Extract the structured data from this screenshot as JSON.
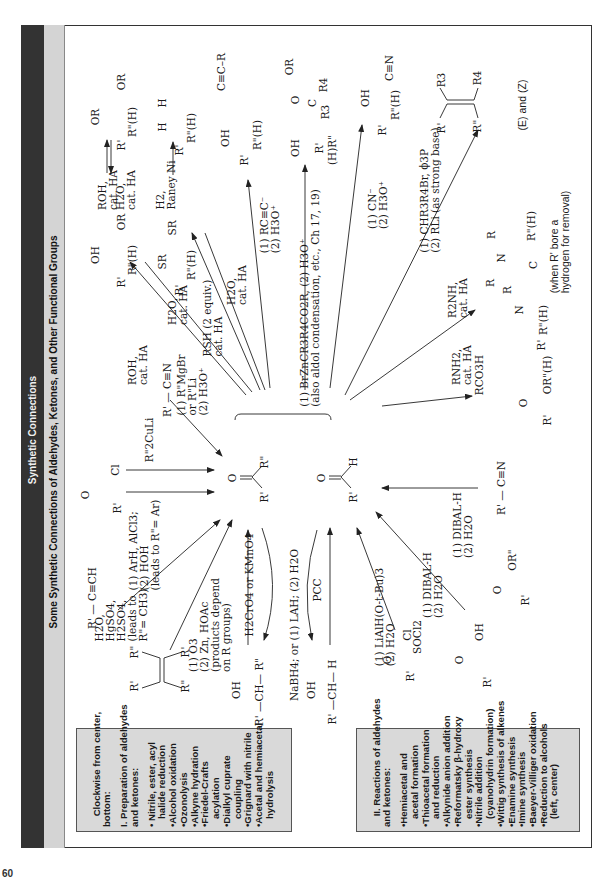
{
  "header": {
    "title": "Synthetic Connections",
    "subtitle": "Some Synthetic Connections of Aldehydes, Ketones, and Other Functional Groups"
  },
  "center": {
    "ketone": {
      "o": "O",
      "left": "R'",
      "right": "R\""
    },
    "aldehyde": {
      "o": "O",
      "left": "R'",
      "right": "H"
    }
  },
  "products": {
    "hemiacetal": {
      "oh": "OH",
      "or": "OR",
      "r1": "R'",
      "r2": "R\"(H)"
    },
    "acetal": {
      "or1": "OR",
      "or2": "OR",
      "r1": "R'",
      "r2": "R\"(H)"
    },
    "acetal_reagents": {
      "forward": "ROH,\ncat. HA",
      "reverse": "H2O,\ncat. HA"
    },
    "thioacetal": {
      "sr1": "SR",
      "sr2": "SR",
      "r1": "R'",
      "r2": "R\"(H)"
    },
    "thio_reduction_reagents": "H2,\nRaney Ni",
    "alkane": {
      "h1": "H",
      "h2": "H",
      "r1": "R'",
      "r2": "R\"(H)"
    },
    "propargyl_alcohol": {
      "oh": "OH",
      "chain": "C≡C–R",
      "r1": "R'",
      "r2": "R\"(H)"
    },
    "beta_hydroxy_ester": {
      "oh": "OH",
      "o": "O",
      "or": "OR",
      "c": "C",
      "r3": "R3",
      "r4": "R4",
      "r1": "R'",
      "r2": "(H)R\""
    },
    "cyanohydrin": {
      "oh": "OH",
      "cn": "C≡N",
      "r1": "R'",
      "r2": "R\"(H)"
    },
    "alkene": {
      "r3": "R3",
      "r4": "R4",
      "r1": "R'",
      "r2": "R\"",
      "note": "(E) and (Z)"
    },
    "enamine": {
      "r_a": "R",
      "r_b": "R",
      "n": "N",
      "c": "C",
      "r2": "R\"(H)",
      "note": "(when R' bore a\nhydrogen for removal)"
    },
    "imine": {
      "r": "R",
      "n": "N",
      "r1": "R'",
      "r2": "R\"(H)"
    },
    "ester": {
      "o": "O",
      "r1": "R'",
      "or": "OR\"(H)"
    }
  },
  "reagents": {
    "hemiacetal_form": "ROH,\ncat. HA",
    "hemiacetal_hydrolysis": "H2O,\ncat. HA",
    "thioacetal_form": "RSH (2 equiv.)\ncat. HA",
    "thioacetal_hydrolysis": "H2O,\ncat. HA",
    "alkynide": "(1) RC≡C⁻\n(2) H3O⁺",
    "reformatsky": "(1) BrZnCR3R4CO2R, (2) H3O⁺\n(also aldol condensation, etc., Ch 17, 19)",
    "cyanide": "(1) CN⁻\n(2) H3O⁺",
    "wittig": "(1) CHR3R4Br, ϕ3P\n(2) RLi (as strong base)",
    "enamine": "R2NH,\ncat. HA",
    "imine": "RNH2,\ncat. HA",
    "baeyer_villiger": "RCO3H",
    "nitrile_dibal": "(1) DIBAL-H\n(2) H2O",
    "ester_dibal": "(1) DIBAL-H\n(2) H2O",
    "acid_chloride_lialh": "(1) LiAlH(O-t-Bu)3\n(2) H2O",
    "socl2": "SOCl2",
    "pcc": "PCC",
    "reduction": "NaBH4; or (1) LAH; (2) H2O",
    "chromate": "H2CrO4 or KMnO4",
    "ozonolysis": "(1) O3\n(2) Zn, HOAc\n(products depend\non R groups)",
    "hydration": "H2O,\nHgSO4,\nH2SO4,\n(leads to\nR\"= CH3)",
    "friedel_crafts": "(1) ArH, AlCl3;\n(2) HOH\n(leads to R\"= Ar)",
    "cuprate": "R\"2CuLi",
    "grignard_nitrile": "(1) R\"MgBr\nor R\"Li\n(2) H3O⁺"
  },
  "starting_materials": {
    "acid_chloride_top": {
      "o": "O",
      "r": "R'",
      "cl": "Cl"
    },
    "nitrile_top": "R' — C≡N",
    "alkyne": "R' — C≡CH",
    "alkene": {
      "r1": "R'",
      "r2": "R\"",
      "r3": "R\"",
      "r4": "R'"
    },
    "sec_alcohol": {
      "oh": "OH",
      "chain": "R' —CH— R\""
    },
    "prim_alcohol": {
      "oh": "OH",
      "chain": "R' —CH— H"
    },
    "acid_chloride_bottom": {
      "o": "O",
      "r": "R'",
      "cl": "Cl"
    },
    "carboxylic_acid": {
      "o": "O",
      "r": "R'",
      "oh": "OH"
    },
    "ester": {
      "o": "O",
      "r": "R'",
      "or": "OR\""
    },
    "nitrile_bottom": "R' — C≡N"
  },
  "legend_preparation": {
    "intro": "Clockwise from center,\nbottom:",
    "heading": "I. Preparation of aldehydes\nand ketones:",
    "items": "• Nitrile, ester, acyl\n   halide reduction\n•Alcohol oxidation\n•Ozonolysis\n•Alkyne hydration\n•Friedel-Crafts\n   acylation\n•Dialkyl cuprate\n   coupling\n•Grignard with nitrile\n•Acetal and hemiacetal\n   hydrolysis"
  },
  "legend_reactions": {
    "heading": "II. Reactions of aldehydes\nand ketones:",
    "items": "•Hemiacetal and\n   acetal formation\n•Thioacetal formation\n   and reduction\n•Alkynide anion addition\n•Reformatsky β-hydroxy\n   ester synthesis\n•Nitrile addition\n   (cyanohydrin formation)\n•Wittig synthesis of alkenes\n•Enamine synthesis\n•Imine synthesis\n•Baeyer-Villiger oxidation\n•Reduction to alcohols\n   (left, center)"
  },
  "page_number": "60",
  "colors": {
    "band_dark": "#333333",
    "band_light": "#d4d4d4",
    "box_fill": "#d9d9d9"
  }
}
